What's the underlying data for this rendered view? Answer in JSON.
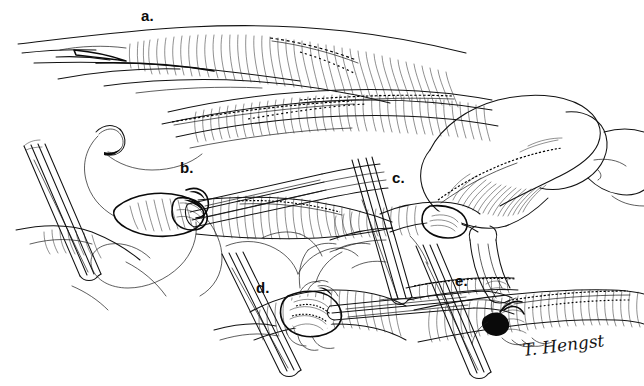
{
  "figure": {
    "background_color": "#ffffff",
    "ink_color": "#111111",
    "width": 644,
    "height": 386,
    "medium": "pen-and-ink line drawing"
  },
  "panels": [
    {
      "id": "a",
      "label": "a.",
      "x": 141,
      "y": 8,
      "description": "Two tubular airway segments with cartilage rings; upper segment shows transected end, lower segment shows completed staple line"
    },
    {
      "id": "b",
      "label": "b.",
      "x": 180,
      "y": 160,
      "description": "Retractor blades hold the field while a curved needle and suture thread pass through the airway opening; instrument jaws inserted in lumen"
    },
    {
      "id": "c",
      "label": "c.",
      "x": 392,
      "y": 170,
      "description": "Large anatomical lobe retracted to expose the stapled anastomosis line along the airway"
    },
    {
      "id": "d",
      "label": "d.",
      "x": 256,
      "y": 280,
      "description": "Forceps grasp the sutured anastomosis; running suture loops visible across the ringed airway wall"
    },
    {
      "id": "e",
      "label": "e.",
      "x": 455,
      "y": 273,
      "description": "Final knot tied and cut at the completed anastomosis with fine forceps"
    }
  ],
  "signature": {
    "name": "artist-signature",
    "text": "T. Hengst"
  }
}
